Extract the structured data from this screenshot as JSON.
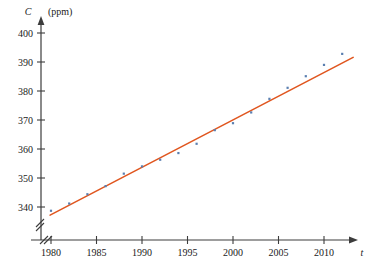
{
  "figure": {
    "clipped_header_text": "",
    "background_color": "#ffffff"
  },
  "chart_data": {
    "type": "scatter",
    "title": "",
    "subtitle": "",
    "xlabel": "t",
    "ylabel": "C",
    "ylabel_unit": "(ppm)",
    "xlim": [
      1978.5,
      2014.5
    ],
    "ylim": [
      334,
      402
    ],
    "axis_break_x": true,
    "axis_break_y": true,
    "grid": false,
    "legend": "none",
    "point_color": "#5a7fb0",
    "line_color": "#e0561f",
    "axis_color": "#3c3c3c",
    "xticks": [
      1980,
      1985,
      1990,
      1995,
      2000,
      2005,
      2010
    ],
    "xtick_labels": [
      "1980",
      "1985",
      "1990",
      "1995",
      "2000",
      "2005",
      "2010"
    ],
    "yticks": [
      340,
      350,
      360,
      370,
      380,
      390,
      400
    ],
    "ytick_labels": [
      "340",
      "350",
      "360",
      "370",
      "380",
      "390",
      "400"
    ],
    "x": [
      1980,
      1982,
      1984,
      1986,
      1988,
      1990,
      1992,
      1994,
      1996,
      1998,
      2000,
      2002,
      2004,
      2006,
      2008,
      2010,
      2012
    ],
    "values": [
      338.7,
      341.2,
      344.4,
      347.2,
      351.5,
      354.0,
      356.3,
      358.6,
      361.8,
      366.5,
      368.9,
      372.6,
      377.3,
      381.1,
      385.1,
      389.0,
      392.8
    ],
    "series": [
      {
        "name": "CO2 concentration",
        "x": [
          1980,
          1982,
          1984,
          1986,
          1988,
          1990,
          1992,
          1994,
          1996,
          1998,
          2000,
          2002,
          2004,
          2006,
          2008,
          2010,
          2012
        ],
        "values": [
          338.7,
          341.2,
          344.4,
          347.2,
          351.5,
          354.0,
          356.3,
          358.6,
          361.8,
          366.5,
          368.9,
          372.6,
          377.3,
          381.1,
          385.1,
          389.0,
          392.8
        ]
      }
    ],
    "trendline": {
      "name": "least-squares regression line",
      "x_start": 1979.9,
      "y_start": 337.2,
      "x_end": 2013.2,
      "y_end": 391.6,
      "slope": 1.635,
      "intercept_year": 1980,
      "intercept_value": 337.4
    },
    "annotations": []
  }
}
